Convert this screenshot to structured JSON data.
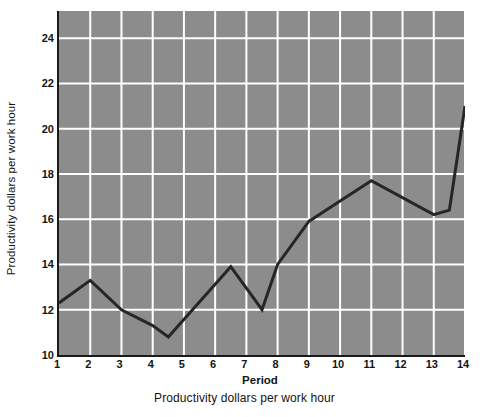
{
  "chart_data": {
    "type": "line",
    "title": "",
    "subtitle": "",
    "xlabel": "Period",
    "ylabel": "Productivity dollars per work hour",
    "caption": "Productivity dollars per work hour",
    "xlim": [
      1,
      14
    ],
    "ylim": [
      10,
      25.2
    ],
    "x_ticks": [
      1,
      2,
      3,
      4,
      5,
      6,
      7,
      8,
      9,
      10,
      11,
      12,
      13,
      14
    ],
    "x_tick_labels": [
      "1",
      "2",
      "3",
      "4",
      "5",
      "6",
      "7",
      "8",
      "9",
      "10",
      "11",
      "12",
      "13",
      "14"
    ],
    "y_ticks": [
      10,
      12,
      14,
      16,
      18,
      20,
      22,
      24
    ],
    "y_tick_labels": [
      "10",
      "12",
      "14",
      "16",
      "18",
      "20",
      "22",
      "24"
    ],
    "grid": true,
    "grid_color": "#ffffff",
    "plot_background": "#8c8c8c",
    "line_color": "#262626",
    "line_width": 3,
    "legend": false,
    "series": [
      {
        "name": "Productivity",
        "x": [
          1,
          2,
          3,
          4,
          4.5,
          6.5,
          7.5,
          8,
          9,
          10,
          11,
          13,
          13.5,
          14
        ],
        "values": [
          12.3,
          13.3,
          12.0,
          11.3,
          10.8,
          13.9,
          12.0,
          14.0,
          15.9,
          16.8,
          17.7,
          16.2,
          16.4,
          21.0
        ]
      }
    ]
  },
  "axis": {
    "y_title": "Productivity dollars per work hour",
    "x_title": "Period",
    "caption": "Productivity dollars per work hour"
  }
}
